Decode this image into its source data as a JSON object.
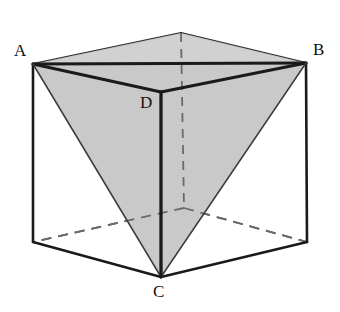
{
  "figure": {
    "background_color": "#ffffff",
    "stroke_color": "#1a1a1a",
    "hidden_stroke_color": "#4d4d4d",
    "shade_color": "#c9c9c9",
    "shade_color_light": "#cfcfcf",
    "thin_stroke_color": "#2b2b2b"
  },
  "labels": {
    "a": "A",
    "b": "B",
    "c": "C",
    "d": "D"
  },
  "label_positions": {
    "a": {
      "left": 14,
      "top": 42
    },
    "b": {
      "left": 313,
      "top": 41
    },
    "c": {
      "left": 153,
      "top": 283
    },
    "d": {
      "left": 140,
      "top": 94
    }
  },
  "geometry": {
    "cube": {
      "front_top_left": [
        33,
        64
      ],
      "front_top_right": [
        306,
        63
      ],
      "back_top": [
        181,
        33
      ],
      "near_top": [
        161,
        92
      ],
      "front_bottom_left": [
        33,
        242
      ],
      "front_bottom_right": [
        307,
        242
      ],
      "back_bottom": [
        184,
        208
      ],
      "near_bottom": [
        161,
        277
      ]
    },
    "tetrahedron": {
      "A": [
        33,
        64
      ],
      "B": [
        306,
        63
      ],
      "C": [
        161,
        277
      ],
      "D": [
        161,
        92
      ]
    },
    "edges_visible": [
      "A-B (top front edge of cube)",
      "A-D",
      "D-B",
      "A-C",
      "B-C",
      "D-C"
    ],
    "edges_hidden_dashed": [
      "back vertical edge of cube",
      "back-bottom to front-bottom-left",
      "back-bottom to front-bottom-right"
    ],
    "shaded_faces": [
      "A-D-B",
      "A-D-C",
      "D-B-C"
    ]
  }
}
